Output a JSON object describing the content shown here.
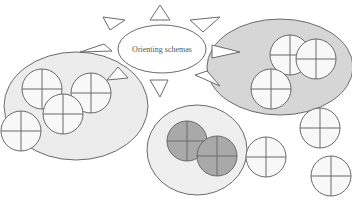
{
  "diagram": {
    "central_label": "Orienting schemas",
    "colors": {
      "background": "#ffffff",
      "left_cluster_fill": "#ececec",
      "right_cluster_fill": "#d6d6d6",
      "bottom_cluster_fill": "#efefef",
      "schema_fill": "#f7f7f7",
      "activated_schema_fill": "#a9a9a9",
      "stroke": "#6a6a6a"
    },
    "rays": 8,
    "clusters": [
      {
        "name": "left-cluster",
        "schemas": 4
      },
      {
        "name": "right-cluster",
        "schemas": 3
      },
      {
        "name": "bottom-cluster",
        "activated_schemas": 2
      }
    ],
    "free_schemas": 3
  }
}
